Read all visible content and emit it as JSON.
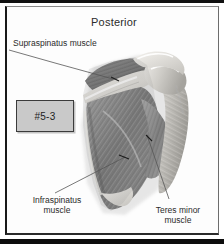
{
  "figure": {
    "title": "Posterior",
    "plate_number": "#5-3",
    "credit": "illustration credit",
    "colors": {
      "frame": "#111111",
      "plate_chip_fill": "#c9c9c9",
      "plate_chip_border": "#3b3b3b",
      "text": "#2b2b2b",
      "leader_line": "#555555",
      "muscle_mid": "#8f8f8f",
      "muscle_dark": "#5d5d5d",
      "bone_light": "#e8e6e2"
    }
  },
  "labels": [
    {
      "id": "supraspinatus",
      "name": "supraspinatus-muscle-label",
      "line1": "Supraspinatus muscle",
      "line2": ""
    },
    {
      "id": "infraspinatus",
      "name": "infraspinatus-muscle-label",
      "line1": "Infraspinatus",
      "line2": "muscle"
    },
    {
      "id": "teres_minor",
      "name": "teres-minor-muscle-label",
      "line1": "Teres minor",
      "line2": "muscle"
    }
  ]
}
